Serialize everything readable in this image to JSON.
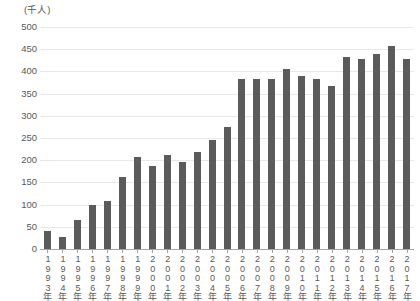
{
  "chart_data": {
    "type": "bar",
    "title": "",
    "subtitle": "",
    "xlabel": "",
    "ylabel": "(千人)",
    "unit_caption": "(千人)",
    "ylim": [
      0,
      500
    ],
    "ytick_step": 50,
    "yticks": [
      "500",
      "450",
      "400",
      "350",
      "300",
      "250",
      "200",
      "150",
      "100",
      "50",
      "0"
    ],
    "ytick_values": [
      500,
      450,
      400,
      350,
      300,
      250,
      200,
      150,
      100,
      50,
      0
    ],
    "grid": true,
    "legend": "none",
    "bar_color": "#5b5b5b",
    "gridline_color": "#e8e8e8",
    "axis_color": "#a6a6a6",
    "text_color": "#595959",
    "categories": [
      "1993年",
      "1994年",
      "1995年",
      "1996年",
      "1997年",
      "1998年",
      "1999年",
      "2000年",
      "2001年",
      "2002年",
      "2003年",
      "2004年",
      "2005年",
      "2006年",
      "2007年",
      "2008年",
      "2009年",
      "2010年",
      "2011年",
      "2012年",
      "2013年",
      "2014年",
      "2015年",
      "2016年",
      "2017年"
    ],
    "values": [
      40,
      28,
      65,
      100,
      108,
      163,
      207,
      188,
      212,
      195,
      218,
      245,
      275,
      382,
      382,
      382,
      405,
      390,
      382,
      368,
      433,
      428,
      440,
      458,
      428
    ]
  }
}
